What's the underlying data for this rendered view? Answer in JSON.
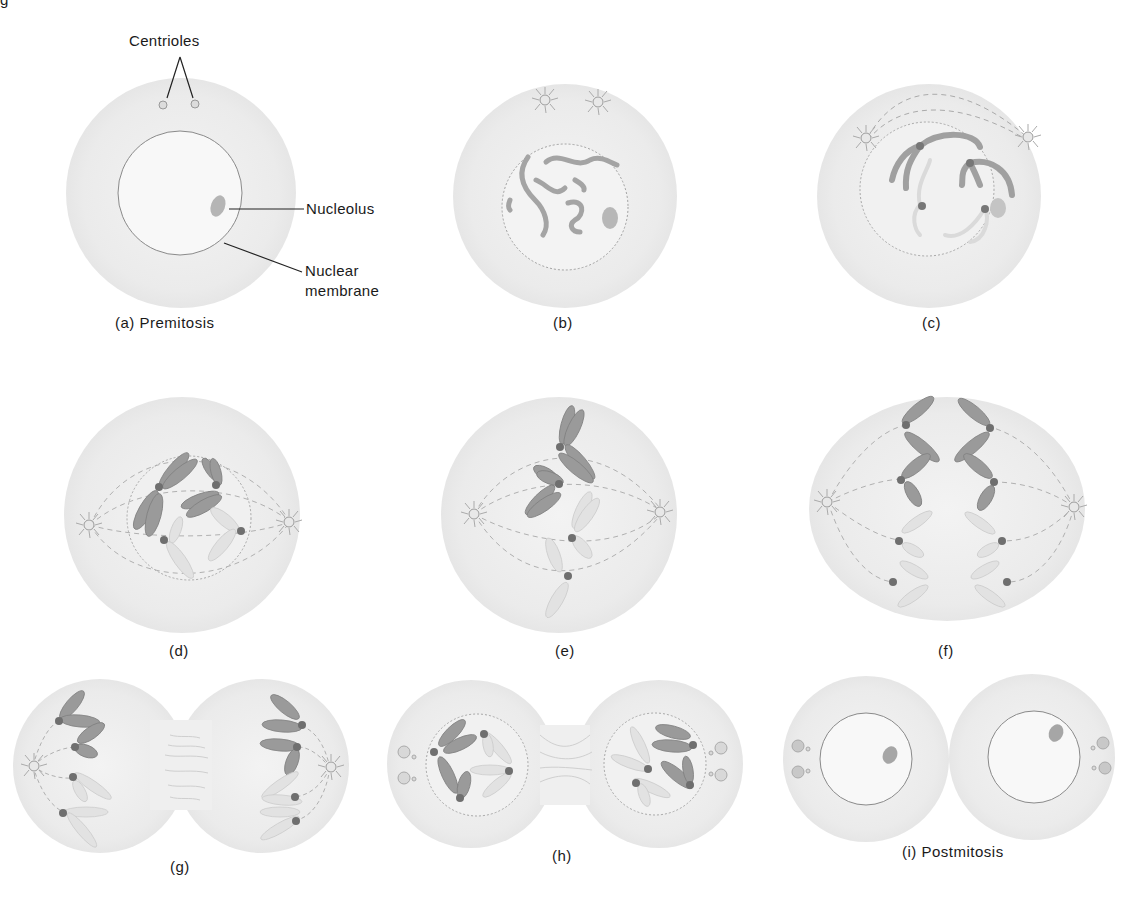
{
  "figure": {
    "top_cut_text": "g",
    "callouts": {
      "centrioles": "Centrioles",
      "nucleolus": "Nucleolus",
      "nuclear_membrane_line1": "Nuclear",
      "nuclear_membrane_line2": "membrane"
    },
    "panels": [
      {
        "id": "a",
        "caption": "(a) Premitosis"
      },
      {
        "id": "b",
        "caption": "(b)"
      },
      {
        "id": "c",
        "caption": "(c)"
      },
      {
        "id": "d",
        "caption": "(d)"
      },
      {
        "id": "e",
        "caption": "(e)"
      },
      {
        "id": "f",
        "caption": "(f)"
      },
      {
        "id": "g",
        "caption": "(g)"
      },
      {
        "id": "h",
        "caption": "(h)"
      },
      {
        "id": "i",
        "caption": "(i) Postmitosis"
      }
    ],
    "colors": {
      "cytoplasm": "#ededed",
      "nucleus": "#f7f7f7",
      "chromosome_dark": "#8f8f8f",
      "chromosome_light": "#dcdcdc",
      "centromere": "#6e6e6e",
      "line": "#333333"
    }
  }
}
